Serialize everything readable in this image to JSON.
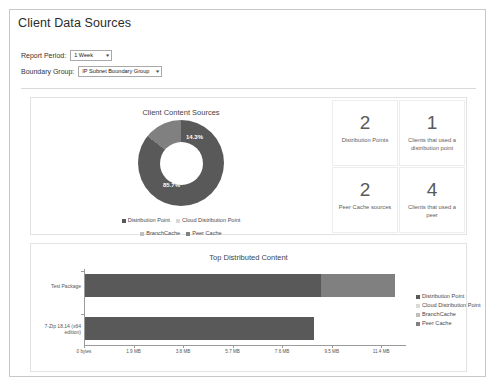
{
  "page": {
    "title": "Client Data Sources"
  },
  "filters": {
    "report_period": {
      "label": "Report Period:",
      "value": "1 Week",
      "caret": "chevron-down-icon"
    },
    "boundary_group": {
      "label": "Boundary Group:",
      "value": "IP Subnet Boundary Group",
      "caret": "chevron-down-icon"
    }
  },
  "kpis": [
    {
      "value": "2",
      "label": "Distribution Points"
    },
    {
      "value": "1",
      "label": "Clients that used a distribution point"
    },
    {
      "value": "2",
      "label": "Peer Cache sources"
    },
    {
      "value": "4",
      "label": "Clients that used a peer"
    }
  ],
  "colors": {
    "distribution_point": "#595959",
    "cloud_distribution_point": "#d9d9d9",
    "branchcache": "#bfbfbf",
    "peer_cache": "#808080",
    "axis": "#9a9a9a",
    "panel_border": "#e2e2e2",
    "frame_border": "#c8c8c8"
  },
  "chart_data": [
    {
      "type": "pie",
      "title": "Client Content Sources",
      "subtype": "donut",
      "categories": [
        "Distribution Point",
        "Cloud Distribution Point",
        "BranchCache",
        "Peer Cache"
      ],
      "values": [
        85.7,
        0,
        0,
        14.3
      ],
      "value_unit": "%",
      "data_labels": [
        "85.7%",
        "14.3%"
      ],
      "legend": [
        "Distribution Point",
        "Cloud Distribution Point",
        "BranchCache",
        "Peer Cache"
      ],
      "legend_position": "bottom",
      "colors": [
        "#595959",
        "#d9d9d9",
        "#bfbfbf",
        "#808080"
      ]
    },
    {
      "type": "bar",
      "orientation": "horizontal",
      "stacked": true,
      "title": "Top Distributed Content",
      "categories": [
        "Test Package",
        "7-Zip 18.14 (x64 edition)"
      ],
      "series": [
        {
          "name": "Distribution Point",
          "values": [
            9.05,
            8.8
          ],
          "color": "#595959"
        },
        {
          "name": "Cloud Distribution Point",
          "values": [
            0,
            0
          ],
          "color": "#d9d9d9"
        },
        {
          "name": "BranchCache",
          "values": [
            0,
            0
          ],
          "color": "#bfbfbf"
        },
        {
          "name": "Peer Cache",
          "values": [
            2.85,
            0
          ],
          "color": "#808080"
        }
      ],
      "xlabel": "",
      "ylabel": "",
      "xlim": [
        0,
        12.35
      ],
      "xtick_labels": [
        "0 bytes",
        "1.9 MB",
        "3.8 MB",
        "5.7 MB",
        "7.6 MB",
        "9.5 MB",
        "11.4 MB"
      ],
      "xtick_values": [
        0,
        1.9,
        3.8,
        5.7,
        7.6,
        9.5,
        11.4
      ],
      "grid": false,
      "legend": [
        "Distribution Point",
        "Cloud Distribution Point",
        "BranchCache",
        "Peer Cache"
      ],
      "legend_position": "right"
    }
  ]
}
